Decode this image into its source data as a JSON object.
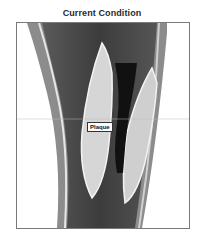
{
  "figure": {
    "title": "Current Condition",
    "annotation": "Plaque",
    "colors": {
      "background": "#ffffff",
      "vessel_wall": "#8c8c8c",
      "lumen": "#3a3a3a",
      "plaque": "#d8d8d8",
      "frame_border": "#7a7a7a"
    }
  }
}
